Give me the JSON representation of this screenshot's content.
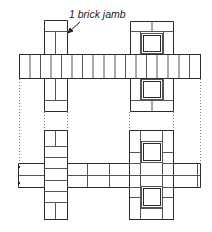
{
  "diagram": {
    "annotation": "1 brick jamb",
    "colors": {
      "line": "#2b2b2b",
      "thin_line": "#555555",
      "dotted": "#888888",
      "background": "#ffffff"
    },
    "views": [
      {
        "name": "upper-course-plan",
        "description": "Wall course with two piers; left pier solid brick, right pier with two inset squares"
      },
      {
        "name": "lower-course-plan",
        "description": "Alternate course of the same wall with piers"
      }
    ]
  }
}
